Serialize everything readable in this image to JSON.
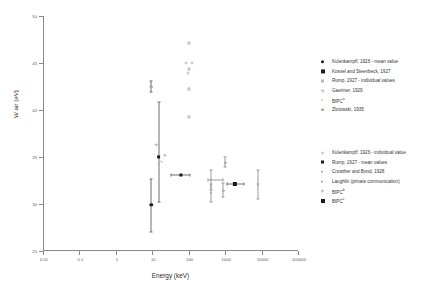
{
  "chart_data": {
    "type": "scatter",
    "title": "",
    "xlabel": "Energy (keV)",
    "ylabel": "W air (eV)",
    "xscale": "log",
    "xlim": [
      0.01,
      100000
    ],
    "ylim": [
      25,
      50
    ],
    "xticks": [
      "0.01",
      "0.1",
      "1",
      "10",
      "100",
      "1000",
      "10000",
      "100000"
    ],
    "xtick_values": [
      0.01,
      0.1,
      1,
      10,
      100,
      1000,
      10000,
      100000
    ],
    "yticks": [
      "25",
      "30",
      "35",
      "40",
      "45",
      "50"
    ],
    "ytick_values": [
      25,
      30,
      35,
      40,
      45,
      50
    ],
    "grid": false,
    "legend_position": "right",
    "series": [
      {
        "name": "Kulenkampff, 1926 - mean value",
        "marker": "filled-circle",
        "points": [
          {
            "x": 9.5,
            "y": 29.9,
            "yerr_low": 27.0,
            "yerr_high": 32.7
          }
        ]
      },
      {
        "name": "Kossel and Steenbeck, 1927",
        "marker": "filled-square",
        "points": [
          {
            "x": 15,
            "y": 35.0,
            "yerr_low": 30.2,
            "yerr_high": 40.8
          }
        ]
      },
      {
        "name": "Rump, 1927 - individual values",
        "marker": "open-square",
        "points": [
          {
            "x": 100,
            "y": 47.1
          },
          {
            "x": 100,
            "y": 44.4
          },
          {
            "x": 100,
            "y": 42.2
          },
          {
            "x": 100,
            "y": 39.3
          }
        ]
      },
      {
        "name": "Gaertner, 1929",
        "marker": "plus",
        "points": [
          {
            "x": 13,
            "y": 36.3
          },
          {
            "x": 22,
            "y": 35.2
          }
        ]
      },
      {
        "name": "BIPC",
        "marker": "open-circle-small",
        "points": [
          {
            "x": 16,
            "y": 34.6
          },
          {
            "x": 18,
            "y": 34.5
          }
        ]
      },
      {
        "name": "Zlotowski, 1935",
        "marker": "grey-square",
        "points": [
          {
            "x": 9.5,
            "y": 42.5,
            "yerr_low": 41.9,
            "yerr_high": 43.1
          }
        ]
      },
      {
        "name": "Kulenkampff, 1926 - individual value",
        "marker": "open-circle",
        "points": [
          {
            "x": 85,
            "y": 45.0
          },
          {
            "x": 125,
            "y": 45.0
          },
          {
            "x": 95,
            "y": 43.9
          }
        ]
      },
      {
        "name": "Rump, 1927 - mean values",
        "marker": "grey-filled-square",
        "points": [
          {
            "x": 60,
            "y": 33.1,
            "xerr_low": 32,
            "xerr_high": 110
          }
        ]
      },
      {
        "name": "Crowther and Bond, 1928",
        "marker": "grey-circle",
        "points": [
          {
            "x": 400,
            "y": 32.6,
            "yerr_low": 31.5,
            "yerr_high": 33.6,
            "xerr_low": 330,
            "xerr_high": 900
          },
          {
            "x": 400,
            "y": 31.2,
            "yerr_low": 30.2,
            "yerr_high": 32.1
          },
          {
            "x": 900,
            "y": 31.4,
            "yerr_low": 30.7,
            "yerr_high": 32.2
          }
        ]
      },
      {
        "name": "Laughlin (private communication)",
        "marker": "grey-circle-err",
        "points": [
          {
            "x": 1000,
            "y": 34.4,
            "yerr_low": 33.9,
            "yerr_high": 35.0
          },
          {
            "x": 8000,
            "y": 32.1,
            "yerr_low": 30.5,
            "yerr_high": 33.6
          }
        ]
      },
      {
        "name": "BIPC",
        "marker": "plus-small",
        "points": [
          {
            "x": 15,
            "y": 34.3
          }
        ]
      },
      {
        "name": "BIPC",
        "marker": "filled-square-large",
        "points": [
          {
            "x": 1900,
            "y": 32.1,
            "xerr_low": 1100,
            "xerr_high": 3200
          }
        ]
      }
    ],
    "legend_groups": [
      {
        "entries": [
          {
            "label": "Kulenkampff, 1926 - mean value",
            "marker": "filled-circle",
            "superscript": ""
          },
          {
            "label": "Kossel and Steenbeck, 1927",
            "marker": "filled-square",
            "superscript": ""
          },
          {
            "label": "Rump, 1927 - individual values",
            "marker": "open-square",
            "superscript": ""
          },
          {
            "label": "Gaertner, 1929",
            "marker": "plus",
            "superscript": ""
          },
          {
            "label": "BIPC",
            "marker": "open-circle-small",
            "superscript": "a"
          },
          {
            "label": "Zlotowski, 1935",
            "marker": "grey-square",
            "superscript": ""
          }
        ]
      },
      {
        "entries": [
          {
            "label": "Kulenkampff, 1926 - individual value",
            "marker": "open-circle",
            "superscript": ""
          },
          {
            "label": "Rump, 1927 - mean values",
            "marker": "grey-filled-square",
            "superscript": ""
          },
          {
            "label": "Crowther and Bond, 1928",
            "marker": "grey-circle",
            "superscript": ""
          },
          {
            "label": "Laughlin (private communication)",
            "marker": "grey-circle-err",
            "superscript": ""
          },
          {
            "label": "BIPC",
            "marker": "plus-small",
            "superscript": "b"
          },
          {
            "label": "BIPC",
            "marker": "filled-square-large",
            "superscript": "c"
          }
        ]
      }
    ]
  }
}
